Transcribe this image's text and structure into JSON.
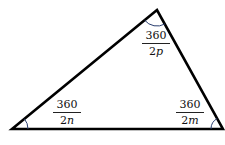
{
  "diagram": {
    "type": "triangle",
    "vertices": {
      "top": {
        "x": 157,
        "y": 10
      },
      "bottom_left": {
        "x": 12,
        "y": 129
      },
      "bottom_right": {
        "x": 223,
        "y": 129
      }
    },
    "edge_color": "#000000",
    "arc_color": "#2b3f70",
    "angles": [
      {
        "vertex": "top",
        "numerator": "360",
        "denominator_coef": "2",
        "denominator_var": "p"
      },
      {
        "vertex": "bottom_left",
        "numerator": "360",
        "denominator_coef": "2",
        "denominator_var": "n"
      },
      {
        "vertex": "bottom_right",
        "numerator": "360",
        "denominator_coef": "2",
        "denominator_var": "m"
      }
    ]
  }
}
